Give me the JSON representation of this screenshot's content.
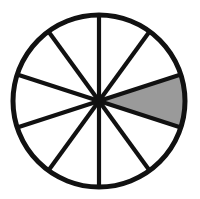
{
  "figure": {
    "name": "fraction-circle",
    "title": "Circle divided into ten equal sectors with one sector shaded",
    "background_color": "#ffffff"
  },
  "geometry": {
    "center_x": 99,
    "center_y": 101,
    "radius": 86,
    "outline_stroke_width": 5,
    "spoke_stroke_width": 4.2
  },
  "colors": {
    "stroke": "#111111",
    "shaded_fill": "#9a9a9a",
    "empty_fill": "#ffffff",
    "background": "#ffffff"
  },
  "chart_data": {
    "type": "pie",
    "title": "Circle divided into ten equal sectors with one sector shaded",
    "total_sectors": 10,
    "sector_angle_degrees": 36,
    "shaded_count": 1,
    "unshaded_count": 9,
    "fraction_shaded": "1/10",
    "percent_shaded": 10,
    "start_angle_degrees": -18,
    "categories": [
      "shaded",
      "unshaded"
    ],
    "values": [
      1,
      9
    ],
    "sectors": [
      {
        "index": 0,
        "start_deg": -18,
        "end_deg": 18,
        "shaded": true
      },
      {
        "index": 1,
        "start_deg": 18,
        "end_deg": 54,
        "shaded": false
      },
      {
        "index": 2,
        "start_deg": 54,
        "end_deg": 90,
        "shaded": false
      },
      {
        "index": 3,
        "start_deg": 90,
        "end_deg": 126,
        "shaded": false
      },
      {
        "index": 4,
        "start_deg": 126,
        "end_deg": 162,
        "shaded": false
      },
      {
        "index": 5,
        "start_deg": 162,
        "end_deg": 198,
        "shaded": false
      },
      {
        "index": 6,
        "start_deg": 198,
        "end_deg": 234,
        "shaded": false
      },
      {
        "index": 7,
        "start_deg": 234,
        "end_deg": 270,
        "shaded": false
      },
      {
        "index": 8,
        "start_deg": 270,
        "end_deg": 306,
        "shaded": false
      },
      {
        "index": 9,
        "start_deg": 306,
        "end_deg": 342,
        "shaded": false
      }
    ],
    "legend": [],
    "annotations": [],
    "grid": false
  }
}
